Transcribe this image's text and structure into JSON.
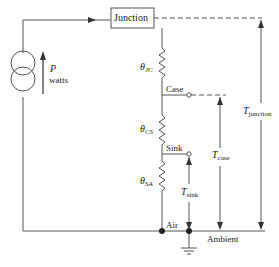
{
  "diagram": {
    "type": "thermal-circuit",
    "source": {
      "symbol": "P",
      "unit": "watts"
    },
    "nodes": {
      "junction": "Junction",
      "case": "Case",
      "sink": "Sink",
      "air": "Air",
      "ambient": "Ambient"
    },
    "resistors": [
      {
        "symbol": "θ",
        "subscript": "JC"
      },
      {
        "symbol": "θ",
        "subscript": "CS"
      },
      {
        "symbol": "θ",
        "subscript": "SA"
      }
    ],
    "temperatures": [
      {
        "symbol": "T",
        "subscript": "junction"
      },
      {
        "symbol": "T",
        "subscript": "case"
      },
      {
        "symbol": "T",
        "subscript": "sink"
      }
    ],
    "colors": {
      "line": "#555555",
      "text": "#222222",
      "background": "#ffffff"
    }
  }
}
